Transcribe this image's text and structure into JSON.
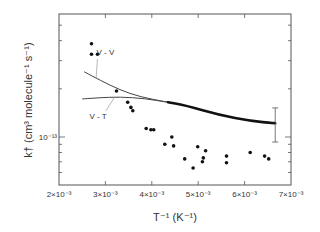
{
  "chart_data": {
    "type": "scatter",
    "title": "",
    "xlabel": "T⁻¹ (K⁻¹)",
    "ylabel": "k† (cm³ molecule⁻¹ s⁻¹)",
    "xscale": "linear",
    "yscale": "log",
    "xlim": [
      0.002,
      0.007
    ],
    "ylim": [
      5e-14,
      5.9e-13
    ],
    "x_ticks": [
      0.002,
      0.003,
      0.004,
      0.005,
      0.006,
      0.007
    ],
    "x_tick_labels": [
      "2×10⁻³",
      "3×10⁻³",
      "4×10⁻³",
      "5×10⁻³",
      "6×10⁻³",
      "7×10⁻³"
    ],
    "y_major_ticks": [
      1e-13
    ],
    "y_major_tick_labels": [
      "10⁻¹³"
    ],
    "y_minor_ticks": [
      6e-14,
      7e-14,
      8e-14,
      9e-14,
      2e-13,
      3e-13,
      4e-13,
      5e-13
    ],
    "grid": false,
    "legend": "none",
    "series": [
      {
        "name": "measurements",
        "kind": "points",
        "x": [
          0.0027,
          0.0027,
          0.00283,
          0.00324,
          0.00348,
          0.00355,
          0.00359,
          0.00388,
          0.00398,
          0.00404,
          0.00443,
          0.00428,
          0.00447,
          0.00471,
          0.00489,
          0.00499,
          0.00516,
          0.00511,
          0.00509,
          0.00561,
          0.00561,
          0.00612,
          0.00643,
          0.00652
        ],
        "y": [
          3.83e-13,
          3.29e-13,
          3.29e-13,
          1.94e-13,
          1.65e-13,
          1.53e-13,
          1.46e-13,
          1.13e-13,
          1.11e-13,
          1.11e-13,
          1e-13,
          9e-14,
          8.8e-14,
          7.3e-14,
          6.4e-14,
          8.7e-14,
          8.2e-14,
          7.4e-14,
          7e-14,
          7.6e-14,
          6.9e-14,
          8e-14,
          7.6e-14,
          7.3e-14
        ]
      },
      {
        "name": "V-V",
        "kind": "line",
        "x": [
          0.00254,
          0.00288,
          0.00331,
          0.00375,
          0.00435
        ],
        "y": [
          2.56e-13,
          2.27e-13,
          1.97e-13,
          1.78e-13,
          1.65e-13
        ]
      },
      {
        "name": "V-T",
        "kind": "line",
        "x": [
          0.0025,
          0.00288,
          0.00331,
          0.00385,
          0.00435
        ],
        "y": [
          1.73e-13,
          1.76e-13,
          1.78e-13,
          1.74e-13,
          1.65e-13
        ]
      },
      {
        "name": "combined",
        "kind": "thick-line",
        "x": [
          0.00435,
          0.00472,
          0.00547,
          0.00612,
          0.00666
        ],
        "y": [
          1.65e-13,
          1.58e-13,
          1.37e-13,
          1.26e-13,
          1.22e-13
        ]
      }
    ],
    "error_bar": {
      "x": 0.00666,
      "y": 1.22e-13,
      "low": 9.3e-14,
      "high": 1.52e-13
    },
    "annotations": [
      {
        "text": "V - V",
        "x": 0.003,
        "y": 3.25e-13,
        "points_to": "V-V"
      },
      {
        "text": "V - T",
        "x": 0.00284,
        "y": 1.3e-13,
        "points_to": "V-T"
      }
    ]
  }
}
